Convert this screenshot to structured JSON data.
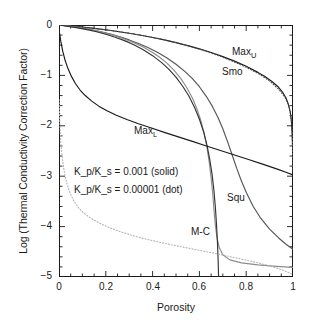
{
  "chart_data": {
    "type": "line",
    "title": "",
    "xlabel": "Porosity",
    "ylabel": "Log (Thermal Conductivity Correction Factor)",
    "xlim": [
      0,
      1.0
    ],
    "ylim": [
      -5,
      0
    ],
    "xticks": [
      "0",
      "0.2",
      "0.4",
      "0.6",
      "0.8",
      "1"
    ],
    "xtick_values": [
      0,
      0.2,
      0.4,
      0.6,
      0.8,
      1.0
    ],
    "yticks": [
      "0",
      "−1",
      "−2",
      "−3",
      "−4",
      "−5"
    ],
    "ytick_values": [
      0,
      -1,
      -2,
      -3,
      -4,
      -5
    ],
    "grid": false,
    "legend_position": "inline-annotations",
    "notes": [
      "K_p/K_s = 0.001 (solid)",
      "K_p/K_s = 0.00001 (dot)"
    ],
    "annotations": [
      {
        "label": "Max",
        "sub": "U",
        "x": 0.78,
        "y": -0.45
      },
      {
        "label": "Smo",
        "sub": "",
        "x": 0.73,
        "y": -0.72
      },
      {
        "label": "Max",
        "sub": "L",
        "x": 0.36,
        "y": -2.07
      },
      {
        "label": "Squ",
        "sub": "",
        "x": 0.72,
        "y": -3.4
      },
      {
        "label": "M-C",
        "sub": "",
        "x": 0.56,
        "y": -4.07
      }
    ],
    "series": [
      {
        "name": "Max_U",
        "style": "solid",
        "color": "#1a1a1a",
        "kratio": "0.001",
        "points": [
          [
            0.0,
            0.0
          ],
          [
            0.02,
            -0.007
          ],
          [
            0.05,
            -0.018
          ],
          [
            0.1,
            -0.04
          ],
          [
            0.15,
            -0.066
          ],
          [
            0.2,
            -0.095
          ],
          [
            0.25,
            -0.128
          ],
          [
            0.3,
            -0.164
          ],
          [
            0.35,
            -0.204
          ],
          [
            0.4,
            -0.248
          ],
          [
            0.45,
            -0.296
          ],
          [
            0.5,
            -0.35
          ],
          [
            0.55,
            -0.409
          ],
          [
            0.6,
            -0.474
          ],
          [
            0.65,
            -0.547
          ],
          [
            0.7,
            -0.627
          ],
          [
            0.75,
            -0.717
          ],
          [
            0.8,
            -0.82
          ],
          [
            0.85,
            -0.94
          ],
          [
            0.88,
            -1.022
          ],
          [
            0.91,
            -1.12
          ],
          [
            0.935,
            -1.22
          ],
          [
            0.955,
            -1.33
          ],
          [
            0.97,
            -1.45
          ],
          [
            0.98,
            -1.57
          ],
          [
            0.988,
            -1.72
          ],
          [
            0.993,
            -1.9
          ],
          [
            0.996,
            -2.12
          ],
          [
            0.998,
            -2.4
          ],
          [
            0.999,
            -2.65
          ],
          [
            1.0,
            -2.95
          ]
        ]
      },
      {
        "name": "Max_U dotted",
        "style": "dotted",
        "color": "#4d4d4d",
        "kratio": "0.00001",
        "points": [
          [
            0.0,
            0.0
          ],
          [
            0.03,
            -0.012
          ],
          [
            0.08,
            -0.033
          ],
          [
            0.14,
            -0.062
          ],
          [
            0.2,
            -0.096
          ],
          [
            0.26,
            -0.134
          ],
          [
            0.32,
            -0.178
          ],
          [
            0.38,
            -0.228
          ],
          [
            0.44,
            -0.284
          ],
          [
            0.5,
            -0.35
          ],
          [
            0.56,
            -0.424
          ],
          [
            0.62,
            -0.508
          ],
          [
            0.68,
            -0.604
          ],
          [
            0.74,
            -0.714
          ],
          [
            0.8,
            -0.838
          ],
          [
            0.86,
            -0.985
          ],
          [
            0.9,
            -1.11
          ],
          [
            0.94,
            -1.28
          ],
          [
            0.965,
            -1.43
          ],
          [
            0.98,
            -1.58
          ],
          [
            0.99,
            -1.76
          ],
          [
            0.996,
            -2.02
          ],
          [
            0.999,
            -2.5
          ],
          [
            1.0,
            -2.95
          ]
        ]
      },
      {
        "name": "Smo",
        "style": "solid",
        "color": "#555555",
        "kratio": "0.001",
        "points": [
          [
            0.0,
            0.0
          ],
          [
            0.03,
            -0.015
          ],
          [
            0.06,
            -0.033
          ],
          [
            0.1,
            -0.062
          ],
          [
            0.14,
            -0.096
          ],
          [
            0.18,
            -0.136
          ],
          [
            0.22,
            -0.182
          ],
          [
            0.26,
            -0.235
          ],
          [
            0.3,
            -0.296
          ],
          [
            0.34,
            -0.366
          ],
          [
            0.38,
            -0.447
          ],
          [
            0.42,
            -0.54
          ],
          [
            0.46,
            -0.65
          ],
          [
            0.5,
            -0.778
          ],
          [
            0.54,
            -0.93
          ],
          [
            0.57,
            -1.065
          ],
          [
            0.6,
            -1.225
          ],
          [
            0.63,
            -1.42
          ],
          [
            0.655,
            -1.61
          ],
          [
            0.68,
            -1.84
          ],
          [
            0.7,
            -2.06
          ],
          [
            0.72,
            -2.31
          ],
          [
            0.74,
            -2.58
          ],
          [
            0.76,
            -2.85
          ],
          [
            0.78,
            -3.1
          ],
          [
            0.8,
            -3.32
          ],
          [
            0.83,
            -3.6
          ],
          [
            0.86,
            -3.82
          ],
          [
            0.9,
            -4.05
          ],
          [
            0.94,
            -4.23
          ],
          [
            0.97,
            -4.35
          ],
          [
            1.0,
            -4.45
          ]
        ]
      },
      {
        "name": "Squ",
        "style": "solid",
        "color": "#8c8c8c",
        "kratio": "0.001",
        "points": [
          [
            0.0,
            0.0
          ],
          [
            0.04,
            -0.022
          ],
          [
            0.08,
            -0.048
          ],
          [
            0.12,
            -0.08
          ],
          [
            0.16,
            -0.118
          ],
          [
            0.2,
            -0.162
          ],
          [
            0.24,
            -0.214
          ],
          [
            0.28,
            -0.276
          ],
          [
            0.32,
            -0.35
          ],
          [
            0.36,
            -0.438
          ],
          [
            0.4,
            -0.545
          ],
          [
            0.43,
            -0.64
          ],
          [
            0.46,
            -0.752
          ],
          [
            0.49,
            -0.89
          ],
          [
            0.52,
            -1.06
          ],
          [
            0.545,
            -1.235
          ],
          [
            0.57,
            -1.45
          ],
          [
            0.59,
            -1.67
          ],
          [
            0.605,
            -1.88
          ],
          [
            0.62,
            -2.14
          ],
          [
            0.632,
            -2.42
          ],
          [
            0.642,
            -2.72
          ],
          [
            0.65,
            -3.03
          ],
          [
            0.657,
            -3.35
          ],
          [
            0.662,
            -3.65
          ],
          [
            0.668,
            -3.96
          ],
          [
            0.675,
            -4.22
          ],
          [
            0.685,
            -4.42
          ],
          [
            0.7,
            -4.56
          ],
          [
            0.73,
            -4.66
          ],
          [
            0.78,
            -4.72
          ],
          [
            0.85,
            -4.76
          ],
          [
            0.93,
            -4.79
          ],
          [
            1.0,
            -4.81
          ]
        ]
      },
      {
        "name": "M-C",
        "style": "solid",
        "color": "#333333",
        "kratio": "0.001",
        "points": [
          [
            0.0,
            0.0
          ],
          [
            0.04,
            -0.026
          ],
          [
            0.08,
            -0.056
          ],
          [
            0.12,
            -0.092
          ],
          [
            0.16,
            -0.134
          ],
          [
            0.2,
            -0.184
          ],
          [
            0.24,
            -0.242
          ],
          [
            0.28,
            -0.31
          ],
          [
            0.32,
            -0.392
          ],
          [
            0.36,
            -0.49
          ],
          [
            0.4,
            -0.608
          ],
          [
            0.44,
            -0.752
          ],
          [
            0.47,
            -0.882
          ],
          [
            0.5,
            -1.035
          ],
          [
            0.53,
            -1.225
          ],
          [
            0.555,
            -1.41
          ],
          [
            0.58,
            -1.64
          ],
          [
            0.6,
            -1.87
          ],
          [
            0.618,
            -2.12
          ],
          [
            0.632,
            -2.38
          ],
          [
            0.644,
            -2.66
          ],
          [
            0.654,
            -2.96
          ],
          [
            0.662,
            -3.28
          ],
          [
            0.668,
            -3.6
          ],
          [
            0.673,
            -3.95
          ],
          [
            0.677,
            -4.3
          ],
          [
            0.68,
            -4.65
          ],
          [
            0.682,
            -5.0
          ]
        ]
      },
      {
        "name": "Max_L",
        "style": "solid",
        "color": "#1a1a1a",
        "kratio": "0.001",
        "points": [
          [
            0.0,
            -0.095
          ],
          [
            0.008,
            -0.33
          ],
          [
            0.016,
            -0.52
          ],
          [
            0.026,
            -0.7
          ],
          [
            0.038,
            -0.86
          ],
          [
            0.052,
            -1.01
          ],
          [
            0.07,
            -1.16
          ],
          [
            0.09,
            -1.29
          ],
          [
            0.112,
            -1.4
          ],
          [
            0.14,
            -1.51
          ],
          [
            0.17,
            -1.61
          ],
          [
            0.205,
            -1.7
          ],
          [
            0.245,
            -1.79
          ],
          [
            0.29,
            -1.875
          ],
          [
            0.34,
            -1.96
          ],
          [
            0.395,
            -2.045
          ],
          [
            0.45,
            -2.13
          ],
          [
            0.51,
            -2.22
          ],
          [
            0.57,
            -2.31
          ],
          [
            0.63,
            -2.4
          ],
          [
            0.69,
            -2.49
          ],
          [
            0.75,
            -2.58
          ],
          [
            0.81,
            -2.67
          ],
          [
            0.87,
            -2.76
          ],
          [
            0.93,
            -2.855
          ],
          [
            0.97,
            -2.92
          ],
          [
            1.0,
            -2.975
          ]
        ]
      },
      {
        "name": "Max_L dotted",
        "style": "dotted",
        "color": "#b0b0b0",
        "kratio": "0.00001",
        "points": [
          [
            0.0,
            -1.48
          ],
          [
            0.004,
            -2.0
          ],
          [
            0.008,
            -2.35
          ],
          [
            0.014,
            -2.64
          ],
          [
            0.022,
            -2.9
          ],
          [
            0.032,
            -3.12
          ],
          [
            0.045,
            -3.31
          ],
          [
            0.062,
            -3.48
          ],
          [
            0.082,
            -3.62
          ],
          [
            0.105,
            -3.73
          ],
          [
            0.135,
            -3.83
          ],
          [
            0.17,
            -3.925
          ],
          [
            0.21,
            -4.01
          ],
          [
            0.255,
            -4.09
          ],
          [
            0.305,
            -4.165
          ],
          [
            0.36,
            -4.235
          ],
          [
            0.42,
            -4.3
          ],
          [
            0.48,
            -4.36
          ],
          [
            0.545,
            -4.42
          ],
          [
            0.61,
            -4.48
          ],
          [
            0.675,
            -4.54
          ],
          [
            0.74,
            -4.605
          ],
          [
            0.8,
            -4.665
          ],
          [
            0.86,
            -4.73
          ],
          [
            0.915,
            -4.8
          ],
          [
            0.96,
            -4.87
          ],
          [
            1.0,
            -4.95
          ]
        ]
      }
    ]
  }
}
